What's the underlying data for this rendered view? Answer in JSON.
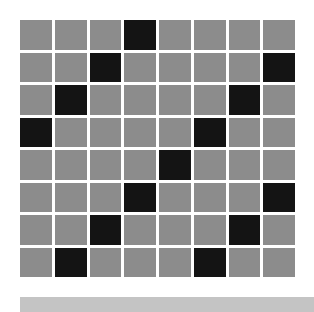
{
  "board": {
    "rows": 8,
    "cols": 8,
    "colors": {
      "off": "#8c8c8c",
      "on": "#141414",
      "gap": "#ffffff"
    },
    "cells": [
      [
        0,
        0,
        0,
        1,
        0,
        0,
        0,
        0
      ],
      [
        0,
        0,
        1,
        0,
        0,
        0,
        0,
        1
      ],
      [
        0,
        1,
        0,
        0,
        0,
        0,
        1,
        0
      ],
      [
        1,
        0,
        0,
        0,
        0,
        1,
        0,
        0
      ],
      [
        0,
        0,
        0,
        0,
        1,
        0,
        0,
        0
      ],
      [
        0,
        0,
        0,
        1,
        0,
        0,
        0,
        1
      ],
      [
        0,
        0,
        1,
        0,
        0,
        0,
        1,
        0
      ],
      [
        0,
        1,
        0,
        0,
        0,
        1,
        0,
        0
      ]
    ]
  },
  "bottom_bar": {
    "color": "#c4c4c4"
  }
}
